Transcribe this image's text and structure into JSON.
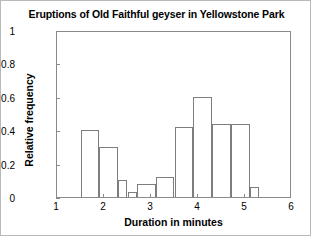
{
  "chart_data": {
    "type": "bar",
    "title": "Eruptions of Old Faithful geyser in Yellowstone Park",
    "xlabel": "Duration in minutes",
    "ylabel": "Relative frequency",
    "xlim": [
      1,
      6
    ],
    "ylim": [
      0,
      1
    ],
    "grid": false,
    "legend": false,
    "bin_width": 0.2,
    "bin_starts": [
      1.5,
      1.7,
      1.9,
      2.1,
      2.3,
      2.5,
      2.7,
      2.9,
      3.1,
      3.3,
      3.5,
      3.7,
      3.9,
      4.1,
      4.3,
      4.5,
      4.7,
      4.9,
      5.1
    ],
    "categories": [
      "1.5-1.9",
      "1.9-2.3",
      "2.3-2.5",
      "2.5-2.7",
      "2.7-3.1",
      "3.1-3.5",
      "3.5-3.9",
      "3.9-4.3",
      "4.3-4.7",
      "4.7-5.1",
      "5.1-5.3"
    ],
    "bars": [
      {
        "x0": 1.5,
        "x1": 1.9,
        "value": 0.4
      },
      {
        "x0": 1.9,
        "x1": 2.3,
        "value": 0.3
      },
      {
        "x0": 2.3,
        "x1": 2.5,
        "value": 0.1
      },
      {
        "x0": 2.5,
        "x1": 2.7,
        "value": 0.03
      },
      {
        "x0": 2.7,
        "x1": 3.1,
        "value": 0.08
      },
      {
        "x0": 3.1,
        "x1": 3.5,
        "value": 0.12
      },
      {
        "x0": 3.5,
        "x1": 3.9,
        "value": 0.42
      },
      {
        "x0": 3.9,
        "x1": 4.3,
        "value": 0.6
      },
      {
        "x0": 4.3,
        "x1": 4.7,
        "value": 0.44
      },
      {
        "x0": 4.7,
        "x1": 5.1,
        "value": 0.44
      },
      {
        "x0": 5.1,
        "x1": 5.3,
        "value": 0.06
      }
    ],
    "values": [
      0.4,
      0.3,
      0.1,
      0.03,
      0.08,
      0.12,
      0.42,
      0.6,
      0.44,
      0.44,
      0.06
    ],
    "yticks": [
      0,
      0.2,
      0.4,
      0.6,
      0.8,
      1
    ],
    "ytick_labels": [
      "0",
      "0.2",
      "0.4",
      "0.6",
      "0.8",
      "1"
    ],
    "xticks": [
      1,
      2,
      3,
      4,
      5,
      6
    ],
    "xtick_labels": [
      "1",
      "2",
      "3",
      "4",
      "5",
      "6"
    ],
    "colors": {
      "bar_edge": "#7d7d7d",
      "bar_fill": "none",
      "axis": "#8a8a8a",
      "text": "#000000",
      "background": "#ffffff"
    }
  }
}
